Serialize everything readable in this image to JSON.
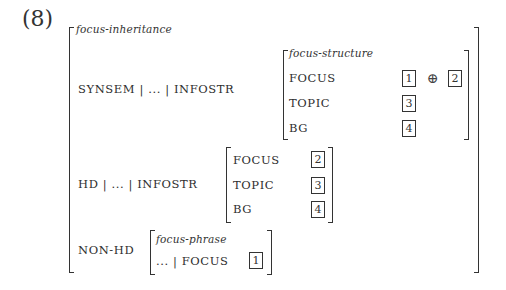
{
  "example": {
    "number": "(8)",
    "type": "focus-inheritance",
    "synsem_row": {
      "path": "SYNSEM | ... | INFOSTR",
      "value": {
        "type": "focus-structure",
        "features": [
          {
            "attr": "FOCUS",
            "tags": [
              "1",
              "2"
            ],
            "operator": "⊕"
          },
          {
            "attr": "TOPIC",
            "tags": [
              "3"
            ]
          },
          {
            "attr": "BG",
            "tags": [
              "4"
            ]
          }
        ]
      }
    },
    "hd_row": {
      "path": "HD | ... | INFOSTR",
      "value": {
        "features": [
          {
            "attr": "FOCUS",
            "tags": [
              "2"
            ]
          },
          {
            "attr": "TOPIC",
            "tags": [
              "3"
            ]
          },
          {
            "attr": "BG",
            "tags": [
              "4"
            ]
          }
        ]
      }
    },
    "nonhd_row": {
      "path": "NON-HD",
      "value": {
        "type": "focus-phrase",
        "feature": {
          "path": "... | FOCUS",
          "tags": [
            "1"
          ]
        }
      }
    }
  }
}
